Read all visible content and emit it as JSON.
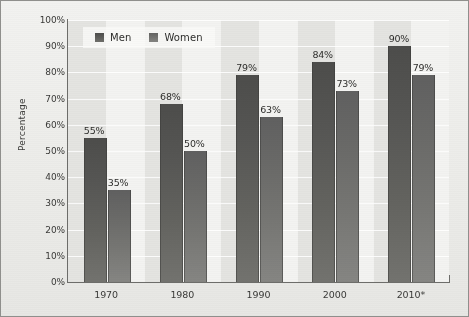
{
  "chart_data": {
    "type": "bar",
    "title": "",
    "xlabel": "",
    "ylabel": "Percentage",
    "ylim": [
      0,
      100
    ],
    "ytick_labels": [
      "100%",
      "90%",
      "80%",
      "70%",
      "60%",
      "50%",
      "40%",
      "30%",
      "20%",
      "10%",
      "0%"
    ],
    "ytick_values": [
      100,
      90,
      80,
      70,
      60,
      50,
      40,
      30,
      20,
      10,
      0
    ],
    "categories": [
      "1970",
      "1980",
      "1990",
      "2000",
      "2010*"
    ],
    "grid": true,
    "legend_position": "top-left",
    "series": [
      {
        "name": "Men",
        "color": "#4d4d4b",
        "values": [
          55,
          68,
          79,
          84,
          90
        ],
        "labels": [
          "55%",
          "68%",
          "79%",
          "84%",
          "90%"
        ]
      },
      {
        "name": "Women",
        "color": "#636361",
        "values": [
          35,
          50,
          63,
          73,
          79
        ],
        "labels": [
          "35%",
          "50%",
          "63%",
          "73%",
          "79%"
        ]
      }
    ]
  }
}
